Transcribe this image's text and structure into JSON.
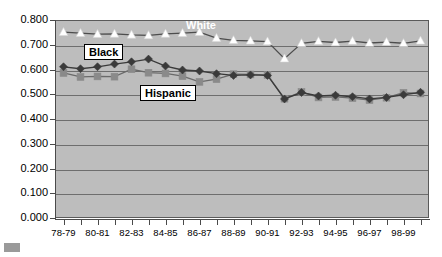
{
  "chart_data": {
    "type": "line",
    "title": "",
    "subtitle": "",
    "xlabel": "",
    "ylabel": "",
    "ylim": [
      0.0,
      0.8
    ],
    "ytick_step": 0.1,
    "ytick_labels": [
      "0.800",
      "0.700",
      "0.600",
      "0.500",
      "0.400",
      "0.300",
      "0.200",
      "0.100",
      "0.000"
    ],
    "ytick_values": [
      0.8,
      0.7,
      0.6,
      0.5,
      0.4,
      0.3,
      0.2,
      0.1,
      0.0
    ],
    "grid": true,
    "grid_axis": "y",
    "legend_position": "inline-annotations",
    "plot_background": "#bdbdbd",
    "x": [
      "78-79",
      "79-80",
      "80-81",
      "81-82",
      "82-83",
      "83-84",
      "84-85",
      "85-86",
      "86-87",
      "87-88",
      "88-89",
      "89-90",
      "90-91",
      "91-92",
      "92-93",
      "93-94",
      "94-95",
      "95-96",
      "96-97",
      "97-98",
      "98-99",
      "99-00"
    ],
    "xtick_labels": [
      "78-79",
      "80-81",
      "82-83",
      "84-85",
      "86-87",
      "88-89",
      "90-91",
      "92-93",
      "94-95",
      "96-97",
      "98-99"
    ],
    "xtick_label_indices": [
      0,
      2,
      4,
      6,
      8,
      10,
      12,
      14,
      16,
      18,
      20
    ],
    "series": [
      {
        "name": "White",
        "color": "#ffffff",
        "line_color": "#4d4d4d",
        "marker": "triangle",
        "values": [
          0.751,
          0.747,
          0.743,
          0.744,
          0.74,
          0.738,
          0.744,
          0.747,
          0.751,
          0.727,
          0.718,
          0.716,
          0.713,
          0.644,
          0.706,
          0.714,
          0.709,
          0.715,
          0.707,
          0.711,
          0.706,
          0.716
        ]
      },
      {
        "name": "Black",
        "color": "#3a3a3a",
        "line_color": "#3a3a3a",
        "marker": "diamond",
        "values": [
          0.611,
          0.603,
          0.611,
          0.622,
          0.631,
          0.642,
          0.614,
          0.598,
          0.594,
          0.583,
          0.576,
          0.578,
          0.576,
          0.481,
          0.507,
          0.493,
          0.496,
          0.49,
          0.481,
          0.487,
          0.498,
          0.508
        ]
      },
      {
        "name": "Hispanic",
        "color": "#8a8a8a",
        "line_color": "#6a6a6a",
        "marker": "square",
        "values": [
          0.586,
          0.57,
          0.572,
          0.571,
          0.601,
          0.587,
          0.584,
          0.573,
          0.55,
          0.561,
          0.581,
          0.58,
          0.578,
          0.482,
          0.509,
          0.487,
          0.489,
          0.484,
          0.476,
          0.486,
          0.506,
          0.503
        ]
      }
    ],
    "annotations": [
      {
        "name": "White",
        "style": "white-text-no-box"
      },
      {
        "name": "Black",
        "style": "boxed"
      },
      {
        "name": "Hispanic",
        "style": "boxed"
      }
    ]
  }
}
